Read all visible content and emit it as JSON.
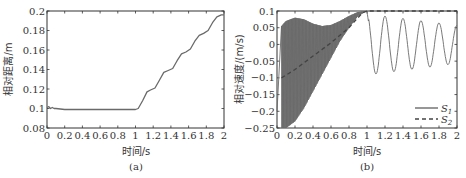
{
  "chart_data": [
    {
      "type": "line",
      "panel": "(a)",
      "title": "",
      "xlabel": "时间/s",
      "ylabel": "相对距离/m",
      "xlim": [
        0,
        2
      ],
      "ylim": [
        0.08,
        0.2
      ],
      "xticks": [
        "0",
        "0.2",
        "0.4",
        "0.6",
        "0.8",
        "1",
        "1.2",
        "1.4",
        "1.6",
        "1.8",
        "2"
      ],
      "yticks": [
        "0.08",
        "0.1",
        "0.12",
        "0.14",
        "0.16",
        "0.18",
        "0.2"
      ],
      "grid": false,
      "series": [
        {
          "name": "relative-distance",
          "style": "solid",
          "x": [
            0,
            0.02,
            0.04,
            0.06,
            0.08,
            0.1,
            0.15,
            0.2,
            0.4,
            0.6,
            0.8,
            1.0,
            1.03,
            1.08,
            1.13,
            1.17,
            1.22,
            1.27,
            1.32,
            1.37,
            1.42,
            1.47,
            1.52,
            1.57,
            1.62,
            1.67,
            1.72,
            1.77,
            1.82,
            1.87,
            1.92,
            1.97,
            2.0
          ],
          "y": [
            0.101,
            0.102,
            0.1,
            0.101,
            0.1,
            0.1,
            0.0995,
            0.099,
            0.099,
            0.099,
            0.099,
            0.099,
            0.1,
            0.108,
            0.117,
            0.119,
            0.121,
            0.129,
            0.137,
            0.139,
            0.141,
            0.149,
            0.156,
            0.158,
            0.161,
            0.169,
            0.175,
            0.177,
            0.18,
            0.188,
            0.194,
            0.196,
            0.196
          ]
        }
      ]
    },
    {
      "type": "line",
      "panel": "(b)",
      "title": "",
      "xlabel": "时间/s",
      "ylabel": "相对速度/(m/s)",
      "xlim": [
        0,
        2
      ],
      "ylim": [
        -0.25,
        0.1
      ],
      "xticks": [
        "0",
        "0.2",
        "0.4",
        "0.6",
        "0.8",
        "1",
        "1.2",
        "1.4",
        "1.6",
        "1.8",
        "2"
      ],
      "yticks": [
        "-0.25",
        "-0.2",
        "-0.15",
        "-0.1",
        "-0.05",
        "0",
        "0.05",
        "0.1"
      ],
      "grid": false,
      "legend": {
        "position": "lower right",
        "entries": [
          "S1",
          "S2"
        ]
      },
      "series": [
        {
          "name": "S1",
          "style": "solid",
          "note": "high-frequency oscillation 0–1 s between envelopes, then decaying ~5 Hz sine 1–2 s",
          "envelope_upper": {
            "x": [
              0.05,
              0.1,
              0.2,
              0.3,
              0.4,
              0.5,
              0.6,
              0.7,
              0.8,
              0.9,
              1.0
            ],
            "y": [
              0.055,
              0.07,
              0.08,
              0.075,
              0.062,
              0.055,
              0.058,
              0.07,
              0.085,
              0.097,
              0.1
            ]
          },
          "envelope_lower": {
            "x": [
              0.05,
              0.1,
              0.2,
              0.3,
              0.4,
              0.5,
              0.6,
              0.7,
              0.8,
              0.9,
              1.0
            ],
            "y": [
              -0.25,
              -0.25,
              -0.23,
              -0.19,
              -0.14,
              -0.09,
              -0.04,
              0.01,
              0.05,
              0.085,
              0.1
            ]
          },
          "x": [
            1.0,
            1.05,
            1.1,
            1.15,
            1.2,
            1.25,
            1.3,
            1.35,
            1.4,
            1.45,
            1.5,
            1.55,
            1.6,
            1.65,
            1.7,
            1.75,
            1.8,
            1.85,
            1.9,
            1.95,
            2.0
          ],
          "y": [
            0.1,
            0.0,
            -0.088,
            0.0,
            0.083,
            0.0,
            -0.08,
            0.0,
            0.075,
            0.0,
            -0.075,
            0.0,
            0.068,
            0.0,
            -0.065,
            0.0,
            0.062,
            0.0,
            -0.06,
            0.0,
            0.055
          ]
        },
        {
          "name": "S2",
          "style": "dashed",
          "x": [
            0.05,
            0.2,
            0.4,
            0.6,
            0.8,
            0.95,
            1.0,
            2.0
          ],
          "y": [
            -0.1,
            -0.075,
            -0.035,
            0.005,
            0.05,
            0.095,
            0.1,
            0.1
          ]
        }
      ]
    }
  ],
  "panels": {
    "a": {
      "caption": "(a)",
      "xlabel": "时间/s",
      "ylabel": "相对距离/m"
    },
    "b": {
      "caption": "(b)",
      "xlabel": "时间/s",
      "ylabel": "相对速度/(m/s)",
      "legend_s1": "S",
      "legend_s1_sub": "1",
      "legend_s2": "S",
      "legend_s2_sub": "2"
    }
  },
  "colors": {
    "line": "#6a6a6a",
    "axis": "#333333",
    "background": "#ffffff"
  }
}
